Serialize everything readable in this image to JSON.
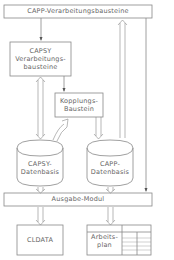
{
  "diagram": {
    "nodes": {
      "capp_modules": {
        "label": "CAPP-Verarbeitungsbausteine"
      },
      "capsy_modules": {
        "line1": "CAPSY",
        "line2": "Verarbeitungs-",
        "line3": "bausteine"
      },
      "coupling": {
        "line1": "Kopplungs-",
        "line2": "Baustein"
      },
      "capsy_db": {
        "line1": "CAPSY-",
        "line2": "Datenbasis"
      },
      "capp_db": {
        "line1": "CAPP-",
        "line2": "Datenbasis"
      },
      "output": {
        "label": "Ausgabe-Modul"
      },
      "cldata": {
        "label": "CLDATA"
      },
      "workplan": {
        "line1": "Arbeits-",
        "line2": "plan"
      }
    },
    "edges": [
      {
        "from": "capp_modules",
        "to": "capsy_modules",
        "type": "arrow"
      },
      {
        "from": "capsy_modules",
        "to": "capsy_db",
        "type": "double-arrow"
      },
      {
        "from": "capsy_modules",
        "to": "coupling",
        "type": "arrow"
      },
      {
        "from": "coupling",
        "to": "capsy_db",
        "type": "double-arrow"
      },
      {
        "from": "coupling",
        "to": "capp_db",
        "type": "double-arrow"
      },
      {
        "from": "capp_db",
        "to": "capp_modules",
        "type": "double-arrow"
      },
      {
        "from": "capp_modules",
        "to": "output",
        "type": "arrow"
      },
      {
        "from": "capsy_db",
        "to": "output",
        "type": "double-arrow"
      },
      {
        "from": "capp_db",
        "to": "output",
        "type": "double-arrow"
      },
      {
        "from": "output",
        "to": "cldata",
        "type": "double-arrow"
      },
      {
        "from": "output",
        "to": "workplan",
        "type": "double-arrow"
      }
    ]
  }
}
